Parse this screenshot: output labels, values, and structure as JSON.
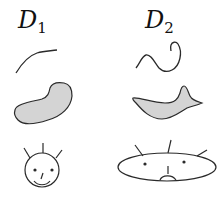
{
  "columns": [
    {
      "label_main": "D",
      "label_sub": "1",
      "description": "Domain 1: open curve, convex blob region, round smiling face"
    },
    {
      "label_main": "D",
      "label_sub": "2",
      "description": "Domain 2: wavy looped curve, curved crescent region, wide frowning face"
    }
  ],
  "rows": [
    "curve",
    "region",
    "face"
  ],
  "colors": {
    "stroke": "#2a2a2a",
    "fill": "#d4d4d4",
    "background": "#ffffff"
  }
}
